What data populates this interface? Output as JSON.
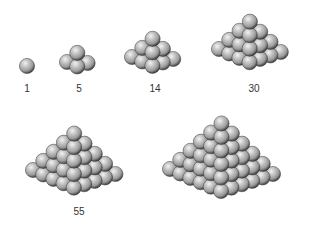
{
  "colors": {
    "background": "#ffffff",
    "sphere_highlight": "#f2f2f2",
    "sphere_mid": "#9a9a9a",
    "sphere_shadow": "#2e2e2e",
    "sphere_outline": "#3a3a3a",
    "label_text": "#333333"
  },
  "sphere_radius": 7.6,
  "projection": {
    "i_step": [
      10.2,
      4.4
    ],
    "j_step": [
      10.4,
      -3.4
    ],
    "layer_up": [
      0,
      -9.6
    ]
  },
  "pyramids": [
    {
      "id": "p1",
      "count": 1,
      "label": "1",
      "base_size": 1,
      "origin": [
        27,
        66
      ],
      "label_pos": [
        27,
        84
      ]
    },
    {
      "id": "p5",
      "count": 5,
      "label": "5",
      "base_size": 2,
      "origin": [
        67,
        62
      ],
      "label_pos": [
        79,
        84
      ]
    },
    {
      "id": "p14",
      "count": 14,
      "label": "14",
      "base_size": 3,
      "origin": [
        132,
        57
      ],
      "label_pos": [
        155,
        84
      ]
    },
    {
      "id": "p30",
      "count": 30,
      "label": "30",
      "base_size": 4,
      "origin": [
        219,
        49
      ],
      "label_pos": [
        254,
        84
      ]
    },
    {
      "id": "p55",
      "count": 55,
      "label": "55",
      "base_size": 5,
      "origin": [
        33,
        170
      ],
      "label_pos": [
        79,
        207
      ]
    },
    {
      "id": "p91",
      "count": 91,
      "label": "",
      "base_size": 6,
      "origin": [
        170,
        169
      ],
      "label_pos": [
        234,
        207
      ]
    }
  ]
}
